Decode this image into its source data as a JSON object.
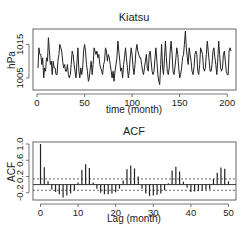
{
  "chart_data": [
    {
      "type": "line",
      "title": "Kiatsu",
      "xlabel": "time (month)",
      "ylabel": "hPa",
      "xlim": [
        0,
        205
      ],
      "ylim": [
        1002,
        1019
      ],
      "xticks": [
        0,
        50,
        100,
        150,
        200
      ],
      "yticks": [
        1005,
        1015
      ],
      "grid": false,
      "series": [
        {
          "name": "Kiatsu",
          "x_start": 1,
          "values": [
            1008,
            1014,
            1012,
            1012,
            1009,
            1011,
            1005,
            1008,
            1007,
            1011,
            1010,
            1017,
            1013,
            1009,
            1010,
            1006,
            1010,
            1008,
            1008,
            1006,
            1006,
            1010,
            1012,
            1015,
            1014,
            1013,
            1010,
            1008,
            1009,
            1007,
            1007,
            1009,
            1006,
            1005,
            1006,
            1009,
            1013,
            1012,
            1009,
            1007,
            1005,
            1010,
            1014,
            1007,
            1005,
            1008,
            1006,
            1008,
            1013,
            1015,
            1013,
            1009,
            1007,
            1004,
            1005,
            1008,
            1010,
            1006,
            1009,
            1014,
            1013,
            1012,
            1013,
            1011,
            1012,
            1009,
            1008,
            1007,
            1006,
            1009,
            1010,
            1014,
            1013,
            1010,
            1012,
            1011,
            1009,
            1007,
            1005,
            1007,
            1004,
            1007,
            1009,
            1011,
            1016,
            1013,
            1010,
            1007,
            1008,
            1005,
            1009,
            1011,
            1014,
            1011,
            1008,
            1005,
            1007,
            1011,
            1014,
            1012,
            1008,
            1006,
            1009,
            1013,
            1015,
            1013,
            1012,
            1011,
            1011,
            1009,
            1007,
            1006,
            1008,
            1010,
            1012,
            1008,
            1007,
            1012,
            1013,
            1010,
            1007,
            1006,
            1007,
            1011,
            1014,
            1010,
            1006,
            1004,
            1003,
            1009,
            1015,
            1008,
            1006,
            1011,
            1016,
            1011,
            1007,
            1006,
            1008,
            1013,
            1016,
            1012,
            1007,
            1006,
            1008,
            1011,
            1014,
            1012,
            1008,
            1005,
            1006,
            1008,
            1011,
            1012,
            1015,
            1019,
            1014,
            1011,
            1009,
            1014,
            1012,
            1010,
            1007,
            1006,
            1008,
            1012,
            1013,
            1012,
            1007,
            1006,
            1009,
            1014,
            1013,
            1012,
            1008,
            1007,
            1008,
            1012,
            1016,
            1013,
            1010,
            1007,
            1007,
            1009,
            1013,
            1014,
            1011,
            1009,
            1006,
            1010,
            1016,
            1012,
            1008,
            1007,
            1008,
            1012,
            1013,
            1010,
            1007,
            1006,
            1006,
            1013,
            1014,
            1013
          ]
        }
      ]
    },
    {
      "type": "bar",
      "title": "ACF",
      "xlabel": "Lag (month)",
      "ylabel": "ACF",
      "xlim": [
        -2,
        52
      ],
      "ylim": [
        -0.38,
        1.05
      ],
      "xticks": [
        0,
        10,
        20,
        30,
        40,
        50
      ],
      "yticks": [
        -0.2,
        0.2,
        0.6,
        1.0
      ],
      "ytick_labels": [
        "-0.2",
        "0.2",
        "0.6",
        "1.0"
      ],
      "grid": false,
      "confidence_bounds": [
        0.14,
        -0.14
      ],
      "zero_line": 0,
      "lags": [
        0,
        1,
        2,
        3,
        4,
        5,
        6,
        7,
        8,
        9,
        10,
        11,
        12,
        13,
        14,
        15,
        16,
        17,
        18,
        19,
        20,
        21,
        22,
        23,
        24,
        25,
        26,
        27,
        28,
        29,
        30,
        31,
        32,
        33,
        34,
        35,
        36,
        37,
        38,
        39,
        40,
        41,
        42,
        43,
        44,
        45,
        46,
        47,
        48,
        49,
        50
      ],
      "values": [
        1.0,
        0.43,
        0.08,
        -0.12,
        -0.18,
        -0.24,
        -0.32,
        -0.27,
        -0.22,
        -0.14,
        0.05,
        0.36,
        0.5,
        0.41,
        0.05,
        -0.1,
        -0.2,
        -0.24,
        -0.24,
        -0.22,
        -0.19,
        -0.1,
        0.1,
        0.38,
        0.47,
        0.4,
        0.2,
        -0.1,
        -0.22,
        -0.28,
        -0.27,
        -0.25,
        -0.22,
        -0.14,
        0.03,
        0.35,
        0.44,
        0.32,
        0.07,
        -0.08,
        -0.18,
        -0.17,
        -0.16,
        -0.15,
        -0.13,
        -0.12,
        0.14,
        0.29,
        0.42,
        0.39,
        0.08
      ]
    }
  ]
}
